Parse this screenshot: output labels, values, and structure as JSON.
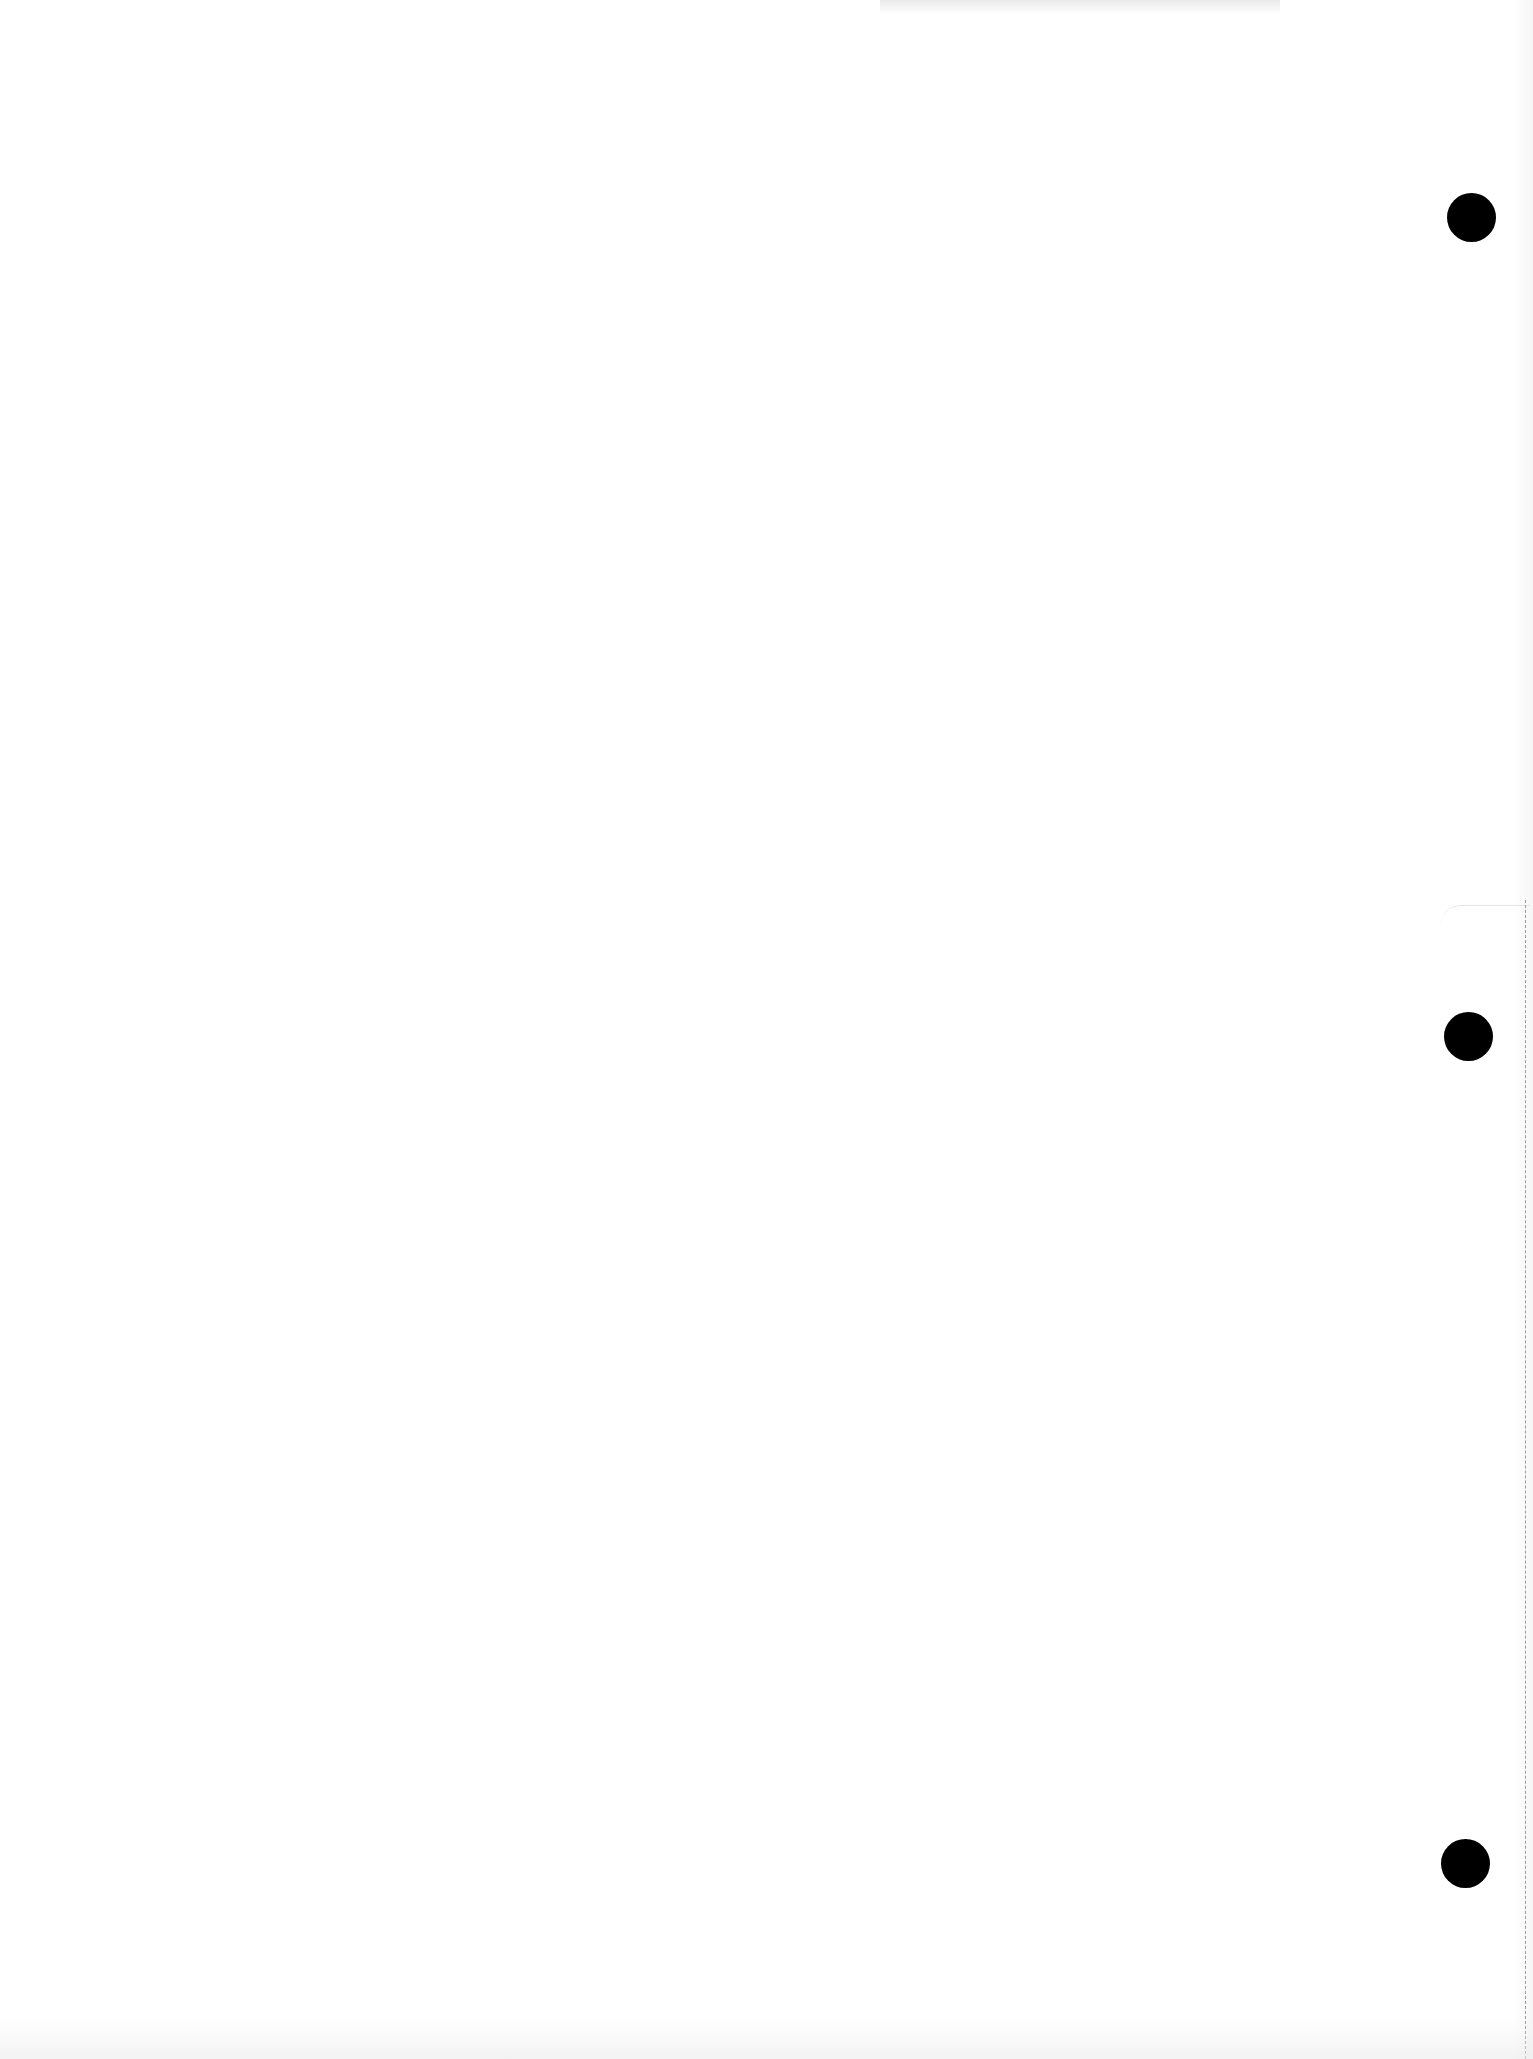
{
  "document": {
    "type": "blank page",
    "text": "",
    "punch_holes": [
      {
        "name": "top",
        "x": 1472,
        "y": 218
      },
      {
        "name": "middle",
        "x": 1469,
        "y": 1037
      },
      {
        "name": "bottom",
        "x": 1466,
        "y": 1864
      }
    ],
    "colors": {
      "paper": "#ffffff",
      "hole": "#000000",
      "perforation": "#9a9a9a"
    }
  }
}
